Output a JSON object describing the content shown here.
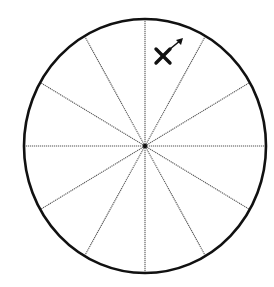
{
  "diagram": {
    "title": "",
    "type": "circle divided into 12 equal sectors",
    "canvas": {
      "width": 274,
      "height": 287,
      "background": "#ffffff"
    },
    "circle": {
      "cx": 145,
      "cy": 146,
      "rx": 121,
      "ry": 127,
      "stroke": "#111111",
      "stroke_width": 2.6
    },
    "spokes": {
      "count": 12,
      "angle_step_deg": 30,
      "stroke": "#555555",
      "stroke_width": 1.1,
      "dashed": true
    },
    "center_point": {
      "x": 145,
      "y": 146,
      "r": 2.2,
      "color": "#111111"
    },
    "marker": {
      "name": "cross-with-arrow",
      "sector": "between 12 o'clock and 1 o'clock spokes",
      "cross_center": {
        "x": 163,
        "y": 56
      },
      "arrow_direction": "up-right",
      "arrow_tip": {
        "x": 183,
        "y": 38
      },
      "color": "#111111"
    }
  }
}
